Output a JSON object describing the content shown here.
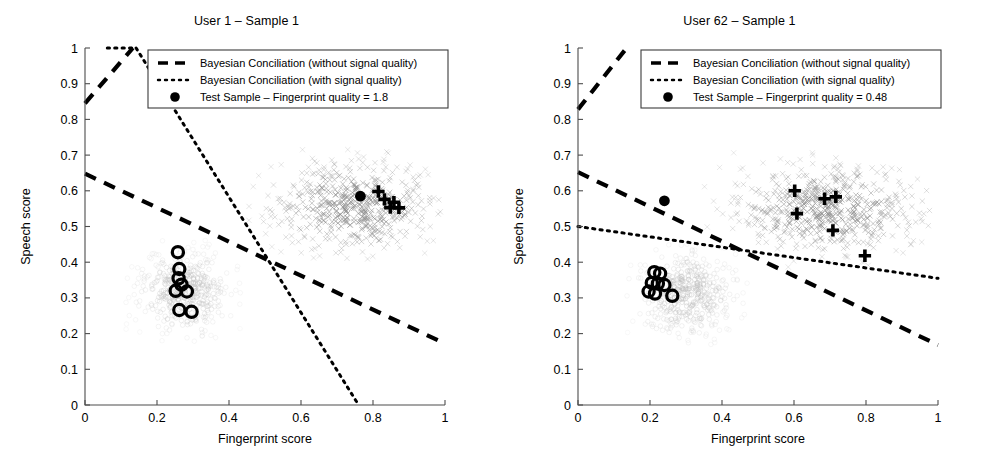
{
  "figure": {
    "background": "#ffffff",
    "axis_color": "#000000",
    "cloud_color": "#b4b4b4",
    "cloud_color_light": "#d8d8d8",
    "marker_color": "#000000"
  },
  "chart_data": [
    {
      "type": "scatter",
      "panel": "left",
      "title": "User 1 – Sample 1",
      "xlabel": "Fingerprint score",
      "ylabel": "Speech score",
      "xlim": [
        0,
        1
      ],
      "ylim": [
        0,
        1
      ],
      "xticks": [
        0,
        0.2,
        0.4,
        0.6,
        0.8,
        1
      ],
      "xticklabels": [
        "0",
        "0.2",
        "0.4",
        "0.6",
        "0.8",
        "1"
      ],
      "yticks": [
        0,
        0.1,
        0.2,
        0.3,
        0.4,
        0.5,
        0.6,
        0.7,
        0.8,
        0.9,
        1
      ],
      "yticklabels": [
        "0",
        "0.1",
        "0.2",
        "0.3",
        "0.4",
        "0.5",
        "0.6",
        "0.7",
        "0.8",
        "0.9",
        "1"
      ],
      "grid": false,
      "legend_position": "top-center",
      "legend": [
        {
          "marker": "dashed-line",
          "label": "Bayesian Conciliation (without signal quality)"
        },
        {
          "marker": "dotted-line",
          "label": "Bayesian Conciliation (with signal quality)"
        },
        {
          "marker": "filled-circle",
          "label": "Test Sample – Fingerprint quality = 1.8"
        }
      ],
      "series": [
        {
          "name": "Bayesian Conciliation (without signal quality)",
          "style": "dashed",
          "segments": [
            {
              "x": [
                0.0,
                0.133
              ],
              "y": [
                0.845,
                1.0
              ]
            },
            {
              "x": [
                0.0,
                1.0
              ],
              "y": [
                0.648,
                0.172
              ]
            }
          ]
        },
        {
          "name": "Bayesian Conciliation (with signal quality)",
          "style": "dotted",
          "segments": [
            {
              "x": [
                0.062,
                0.142
              ],
              "y": [
                1.0,
                1.0
              ]
            },
            {
              "x": [
                0.142,
                0.76
              ],
              "y": [
                1.0,
                0.0
              ]
            }
          ]
        },
        {
          "name": "Test Sample – Fingerprint quality = 1.8",
          "style": "filled-circle",
          "points": [
            [
              0.765,
              0.585
            ]
          ]
        },
        {
          "name": "Genuine test markers",
          "style": "plus",
          "points": [
            [
              0.815,
              0.598
            ],
            [
              0.832,
              0.576
            ],
            [
              0.858,
              0.568
            ],
            [
              0.872,
              0.552
            ],
            [
              0.848,
              0.553
            ]
          ]
        },
        {
          "name": "Impostor test markers",
          "style": "open-circle",
          "points": [
            [
              0.258,
              0.428
            ],
            [
              0.262,
              0.381
            ],
            [
              0.26,
              0.355
            ],
            [
              0.268,
              0.337
            ],
            [
              0.252,
              0.32
            ],
            [
              0.283,
              0.318
            ],
            [
              0.262,
              0.266
            ],
            [
              0.296,
              0.261
            ]
          ]
        },
        {
          "name": "Genuine score cloud",
          "style": "x-cloud",
          "center": [
            0.745,
            0.555
          ],
          "spread": [
            0.115,
            0.062
          ],
          "n": 520
        },
        {
          "name": "Impostor score cloud",
          "style": "o-cloud",
          "center": [
            0.275,
            0.318
          ],
          "spread": [
            0.062,
            0.056
          ],
          "n": 420
        }
      ]
    },
    {
      "type": "scatter",
      "panel": "right",
      "title": "User 62 – Sample 1",
      "xlabel": "Fingerprint score",
      "ylabel": "Speech score",
      "xlim": [
        0,
        1
      ],
      "ylim": [
        0,
        1
      ],
      "xticks": [
        0,
        0.2,
        0.4,
        0.6,
        0.8,
        1
      ],
      "xticklabels": [
        "0",
        "0.2",
        "0.4",
        "0.6",
        "0.8",
        "1"
      ],
      "yticks": [
        0,
        0.1,
        0.2,
        0.3,
        0.4,
        0.5,
        0.6,
        0.7,
        0.8,
        0.9,
        1
      ],
      "yticklabels": [
        "0",
        "0.1",
        "0.2",
        "0.3",
        "0.4",
        "0.5",
        "0.6",
        "0.7",
        "0.8",
        "0.9",
        "1"
      ],
      "grid": false,
      "legend_position": "top-center",
      "legend": [
        {
          "marker": "dashed-line",
          "label": "Bayesian Conciliation (without signal quality)"
        },
        {
          "marker": "dotted-line",
          "label": "Bayesian Conciliation (with signal quality)"
        },
        {
          "marker": "filled-circle",
          "label": "Test Sample – Fingerprint quality = 0.48"
        }
      ],
      "series": [
        {
          "name": "Bayesian Conciliation (without signal quality)",
          "style": "dashed",
          "segments": [
            {
              "x": [
                0.0,
                0.135
              ],
              "y": [
                0.828,
                1.0
              ]
            },
            {
              "x": [
                0.0,
                1.0
              ],
              "y": [
                0.652,
                0.168
              ]
            }
          ]
        },
        {
          "name": "Bayesian Conciliation (with signal quality)",
          "style": "dotted",
          "segments": [
            {
              "x": [
                0.0,
                1.0
              ],
              "y": [
                0.5,
                0.355
              ]
            }
          ]
        },
        {
          "name": "Test Sample – Fingerprint quality = 0.48",
          "style": "filled-circle",
          "points": [
            [
              0.24,
              0.572
            ]
          ]
        },
        {
          "name": "Genuine test markers",
          "style": "plus",
          "points": [
            [
              0.602,
              0.6
            ],
            [
              0.608,
              0.536
            ],
            [
              0.685,
              0.578
            ],
            [
              0.716,
              0.583
            ],
            [
              0.708,
              0.489
            ],
            [
              0.797,
              0.418
            ]
          ]
        },
        {
          "name": "Impostor test markers",
          "style": "open-circle",
          "points": [
            [
              0.212,
              0.372
            ],
            [
              0.228,
              0.368
            ],
            [
              0.205,
              0.342
            ],
            [
              0.222,
              0.34
            ],
            [
              0.24,
              0.336
            ],
            [
              0.196,
              0.318
            ],
            [
              0.214,
              0.312
            ],
            [
              0.262,
              0.306
            ]
          ]
        },
        {
          "name": "Genuine score cloud",
          "style": "x-cloud",
          "center": [
            0.7,
            0.548
          ],
          "spread": [
            0.135,
            0.063
          ],
          "n": 560
        },
        {
          "name": "Impostor score cloud",
          "style": "o-cloud",
          "center": [
            0.3,
            0.312
          ],
          "spread": [
            0.07,
            0.058
          ],
          "n": 430
        }
      ]
    }
  ]
}
